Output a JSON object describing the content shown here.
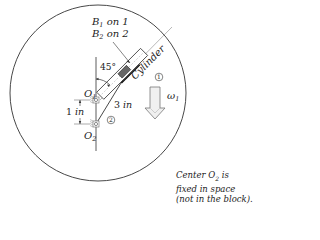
{
  "diagram": {
    "labels": {
      "b1": "B",
      "b1_sub": "1",
      "b1_rest": " on 1",
      "b2": "B",
      "b2_sub": "2",
      "b2_rest": " on 2",
      "angle": "45°",
      "cylinder": "Cylinder",
      "body1": "1",
      "body2": "2",
      "o1": "O",
      "o1_sub": "1",
      "o2": "O",
      "o2_sub": "2",
      "length": "3",
      "length_unit": "in",
      "offset": "1",
      "offset_unit": "in",
      "omega": "ω",
      "omega_sub": "1"
    },
    "note": {
      "line1_a": "Center O",
      "line1_sub": "2",
      "line1_b": " is",
      "line2": "fixed in space",
      "line3": "(not in the block)."
    }
  }
}
